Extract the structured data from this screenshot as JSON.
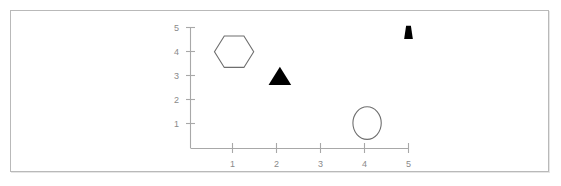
{
  "figure": {
    "border_color": "#b9b9b9",
    "background_color": "#ffffff",
    "axis_color": "#a8a8a8",
    "label_color": "#8a8a8a",
    "outline_color": "#6e6e6e",
    "fill_color": "#000000"
  },
  "chart_data": {
    "type": "scatter",
    "title": "",
    "subtitle": "",
    "xlabel": "",
    "ylabel": "",
    "xlim": [
      0,
      5.3
    ],
    "ylim": [
      0,
      5.3
    ],
    "xticks": [
      1,
      2,
      3,
      4,
      5
    ],
    "yticks": [
      1,
      2,
      3,
      4,
      5
    ],
    "xtick_labels": [
      "1",
      "2",
      "3",
      "4",
      "5"
    ],
    "ytick_labels": [
      "1",
      "2",
      "3",
      "4",
      "5"
    ],
    "grid": false,
    "legend": false,
    "legend_position": "none",
    "annotations": [],
    "markers": [
      {
        "name": "hexagon-marker",
        "shape": "hexagon",
        "filled": false,
        "x": 1.0,
        "y": 4.0,
        "size_x": 0.9,
        "size_y": 1.5
      },
      {
        "name": "triangle-marker",
        "shape": "triangle",
        "filled": true,
        "x": 2.05,
        "y": 3.0,
        "size_x": 0.52,
        "size_y": 0.75
      },
      {
        "name": "ellipse-marker",
        "shape": "ellipse",
        "filled": false,
        "x": 4.05,
        "y": 1.05,
        "size_x": 0.65,
        "size_y": 1.35
      },
      {
        "name": "wedge-marker",
        "shape": "trapezoid",
        "filled": true,
        "x": 5.0,
        "y": 4.8,
        "size_x": 0.2,
        "size_y": 0.55
      }
    ]
  },
  "axes": {
    "y_labels": [
      "5",
      "4",
      "3",
      "2",
      "1"
    ],
    "x_labels": [
      "1",
      "2",
      "3",
      "4",
      "5"
    ]
  }
}
